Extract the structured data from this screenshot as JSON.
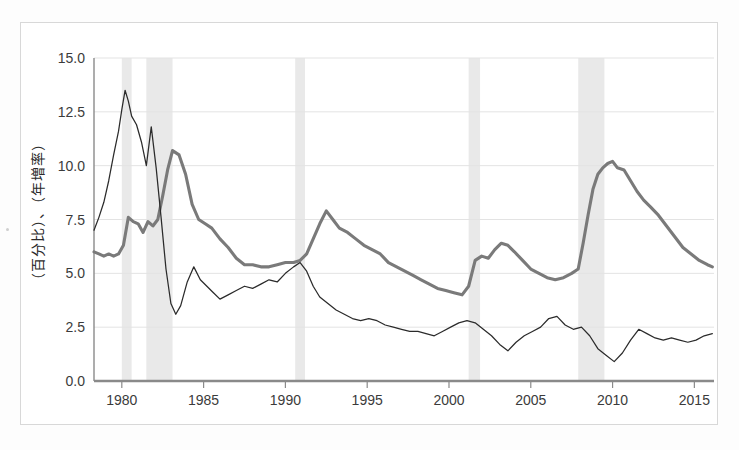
{
  "figure": {
    "kind": "scanned-line-chart",
    "background_color": "#ffffff",
    "frame_color": "#d8d8d8"
  },
  "axis": {
    "y_title": "（百分比）、（年増率）",
    "y_ticks": [
      "0.0",
      "2.5",
      "5.0",
      "7.5",
      "10.0",
      "12.5",
      "15.0"
    ],
    "x_ticks": [
      "1980",
      "1985",
      "1990",
      "1995",
      "2000",
      "2005",
      "2010",
      "2015"
    ]
  },
  "colors": {
    "thick_series": "#7a7a7a",
    "thin_series": "#2b2b2b",
    "recession_band": "#e9e9e9",
    "gridline": "#e3e3e3",
    "axis": "#8a8a8a"
  },
  "chart_data": {
    "type": "line",
    "title": "",
    "subtitle": "",
    "xlabel": "",
    "ylabel": "（百分比）、（年増率）",
    "xlim": [
      1978.3,
      2016.2
    ],
    "ylim": [
      0.0,
      15.0
    ],
    "yticks": [
      0.0,
      2.5,
      5.0,
      7.5,
      10.0,
      12.5,
      15.0
    ],
    "xticks": [
      1980,
      1985,
      1990,
      1995,
      2000,
      2005,
      2010,
      2015
    ],
    "grid": "horizontal",
    "legend": "none",
    "annotations": [
      {
        "type": "vspan",
        "label": "recession",
        "x0": 1980.0,
        "x1": 1980.6
      },
      {
        "type": "vspan",
        "label": "recession",
        "x0": 1981.5,
        "x1": 1983.1
      },
      {
        "type": "vspan",
        "label": "recession",
        "x0": 1990.6,
        "x1": 1991.2
      },
      {
        "type": "vspan",
        "label": "recession",
        "x0": 2001.2,
        "x1": 2001.9
      },
      {
        "type": "vspan",
        "label": "recession",
        "x0": 2007.9,
        "x1": 2009.5
      }
    ],
    "series": [
      {
        "name": "thin-line-series",
        "style": "thin dark line",
        "color": "#2b2b2b",
        "x": [
          1978.3,
          1978.6,
          1978.9,
          1979.2,
          1979.5,
          1979.8,
          1980.0,
          1980.2,
          1980.4,
          1980.6,
          1980.9,
          1981.2,
          1981.5,
          1981.8,
          1982.1,
          1982.4,
          1982.7,
          1983.0,
          1983.3,
          1983.6,
          1984.0,
          1984.4,
          1984.8,
          1985.2,
          1985.6,
          1986.0,
          1986.5,
          1987.0,
          1987.5,
          1988.0,
          1988.5,
          1989.0,
          1989.5,
          1990.0,
          1990.5,
          1990.9,
          1991.3,
          1991.7,
          1992.1,
          1992.6,
          1993.1,
          1993.6,
          1994.1,
          1994.6,
          1995.1,
          1995.6,
          1996.1,
          1996.6,
          1997.1,
          1997.6,
          1998.1,
          1998.6,
          1999.1,
          1999.6,
          2000.1,
          2000.6,
          2001.1,
          2001.6,
          2002.1,
          2002.6,
          2003.1,
          2003.6,
          2004.1,
          2004.6,
          2005.1,
          2005.6,
          2006.1,
          2006.6,
          2007.1,
          2007.6,
          2008.1,
          2008.6,
          2009.1,
          2009.6,
          2010.1,
          2010.6,
          2011.1,
          2011.6,
          2012.1,
          2012.6,
          2013.1,
          2013.6,
          2014.1,
          2014.6,
          2015.1,
          2015.6,
          2016.1
        ],
        "y": [
          7.0,
          7.6,
          8.3,
          9.3,
          10.5,
          11.6,
          12.6,
          13.5,
          13.0,
          12.3,
          11.9,
          11.1,
          10.0,
          11.8,
          9.9,
          7.6,
          5.2,
          3.6,
          3.1,
          3.5,
          4.6,
          5.3,
          4.7,
          4.4,
          4.1,
          3.8,
          4.0,
          4.2,
          4.4,
          4.3,
          4.5,
          4.7,
          4.6,
          5.0,
          5.3,
          5.5,
          5.1,
          4.4,
          3.9,
          3.6,
          3.3,
          3.1,
          2.9,
          2.8,
          2.9,
          2.8,
          2.6,
          2.5,
          2.4,
          2.3,
          2.3,
          2.2,
          2.1,
          2.3,
          2.5,
          2.7,
          2.8,
          2.7,
          2.4,
          2.1,
          1.7,
          1.4,
          1.8,
          2.1,
          2.3,
          2.5,
          2.9,
          3.0,
          2.6,
          2.4,
          2.5,
          2.1,
          1.5,
          1.2,
          0.9,
          1.3,
          1.9,
          2.4,
          2.2,
          2.0,
          1.9,
          2.0,
          1.9,
          1.8,
          1.9,
          2.1,
          2.2
        ],
        "peak": {
          "x": 1980.2,
          "y": 13.5
        }
      },
      {
        "name": "thick-line-series",
        "style": "thick gray line",
        "color": "#7a7a7a",
        "x": [
          1978.3,
          1978.6,
          1978.9,
          1979.2,
          1979.5,
          1979.8,
          1980.1,
          1980.4,
          1980.7,
          1981.0,
          1981.3,
          1981.6,
          1981.9,
          1982.2,
          1982.5,
          1982.8,
          1983.1,
          1983.5,
          1983.9,
          1984.3,
          1984.7,
          1985.1,
          1985.5,
          1986.0,
          1986.5,
          1987.0,
          1987.5,
          1988.0,
          1988.5,
          1989.0,
          1989.5,
          1990.0,
          1990.5,
          1990.9,
          1991.3,
          1991.7,
          1992.1,
          1992.5,
          1992.9,
          1993.3,
          1993.8,
          1994.3,
          1994.8,
          1995.3,
          1995.8,
          1996.3,
          1996.8,
          1997.3,
          1997.8,
          1998.3,
          1998.8,
          1999.3,
          1999.8,
          2000.3,
          2000.8,
          2001.2,
          2001.6,
          2002.0,
          2002.4,
          2002.8,
          2003.2,
          2003.6,
          2004.0,
          2004.5,
          2005.0,
          2005.5,
          2006.0,
          2006.5,
          2007.0,
          2007.5,
          2007.9,
          2008.2,
          2008.5,
          2008.8,
          2009.1,
          2009.4,
          2009.7,
          2010.0,
          2010.3,
          2010.7,
          2011.1,
          2011.5,
          2011.9,
          2012.3,
          2012.8,
          2013.3,
          2013.8,
          2014.3,
          2014.8,
          2015.3,
          2015.8,
          2016.1
        ],
        "y": [
          6.0,
          5.9,
          5.8,
          5.9,
          5.8,
          5.9,
          6.3,
          7.6,
          7.4,
          7.3,
          6.9,
          7.4,
          7.2,
          7.5,
          8.6,
          9.8,
          10.7,
          10.5,
          9.6,
          8.2,
          7.5,
          7.3,
          7.1,
          6.6,
          6.2,
          5.7,
          5.4,
          5.4,
          5.3,
          5.3,
          5.4,
          5.5,
          5.5,
          5.6,
          5.9,
          6.6,
          7.3,
          7.9,
          7.5,
          7.1,
          6.9,
          6.6,
          6.3,
          6.1,
          5.9,
          5.5,
          5.3,
          5.1,
          4.9,
          4.7,
          4.5,
          4.3,
          4.2,
          4.1,
          4.0,
          4.4,
          5.6,
          5.8,
          5.7,
          6.1,
          6.4,
          6.3,
          6.0,
          5.6,
          5.2,
          5.0,
          4.8,
          4.7,
          4.8,
          5.0,
          5.2,
          6.4,
          7.7,
          8.9,
          9.6,
          9.9,
          10.1,
          10.2,
          9.9,
          9.8,
          9.3,
          8.8,
          8.4,
          8.1,
          7.7,
          7.2,
          6.7,
          6.2,
          5.9,
          5.6,
          5.4,
          5.3
        ],
        "peak": {
          "x": 1983.1,
          "y": 10.7
        }
      }
    ]
  }
}
